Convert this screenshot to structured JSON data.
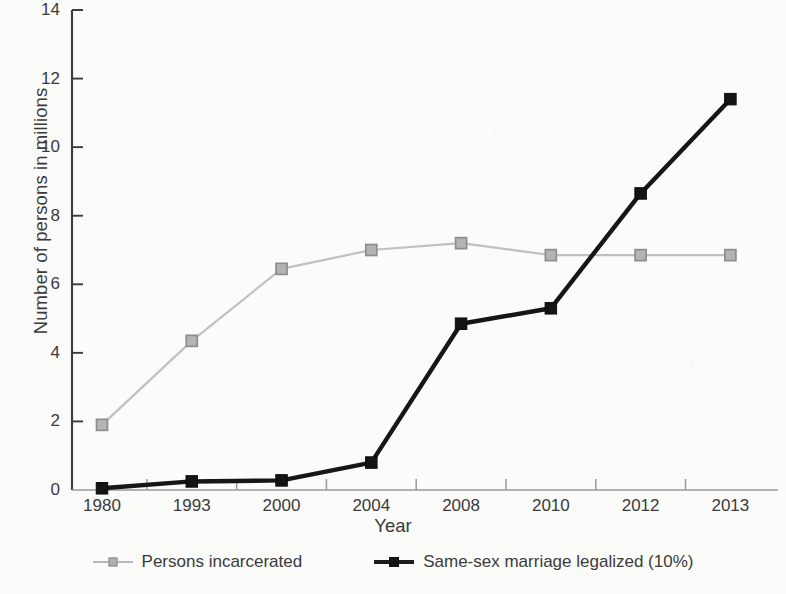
{
  "chart_data": {
    "type": "line",
    "title": "",
    "xlabel": "Year",
    "ylabel": "Number of persons in millions",
    "categories": [
      "1980",
      "1993",
      "2000",
      "2004",
      "2008",
      "2010",
      "2012",
      "2013"
    ],
    "ylim": [
      0,
      14
    ],
    "ytick_labels": [
      "0",
      "2",
      "4",
      "6",
      "8",
      "10",
      "12",
      "14"
    ],
    "ytick_values": [
      0,
      2,
      4,
      6,
      8,
      10,
      12,
      14
    ],
    "grid": false,
    "legend_position": "bottom",
    "series": [
      {
        "name": "Persons incarcerated",
        "color": "#b0b0b0",
        "marker": "square-open",
        "values": [
          1.9,
          4.35,
          6.45,
          7.0,
          7.2,
          6.85,
          6.85,
          6.85
        ]
      },
      {
        "name": "Same-sex marriage legalized (10%)",
        "color": "#141414",
        "marker": "square-filled",
        "values": [
          0.05,
          0.25,
          0.28,
          0.8,
          4.85,
          5.3,
          8.65,
          11.4
        ]
      }
    ]
  }
}
